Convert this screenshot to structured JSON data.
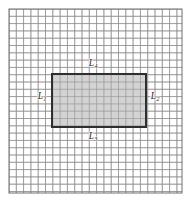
{
  "figure": {
    "background_color": "#ffffff",
    "frame": {
      "name": "outer-frame",
      "stroke_color": "#6f6f6f",
      "stroke_width": 1,
      "x": 9,
      "y": 9,
      "width": 173,
      "height": 184
    },
    "grid": {
      "name": "graph-paper-grid",
      "line_color": "#8d8d8d",
      "line_width": 0.75,
      "cell_size": 7.3,
      "columns": 23,
      "rows": 25
    },
    "region": {
      "name": "shaded-rectangle",
      "fill_color": "#c6c6c6",
      "fill_opacity": 0.78,
      "stroke_color": "#2f2f2f",
      "stroke_width": 2,
      "x": 52,
      "y": 74,
      "width": 94,
      "height": 53
    },
    "labels": [
      {
        "id": "label-L1",
        "name": "edge-label-L1",
        "base": "L",
        "subscript": "1",
        "edge": "left",
        "x": 42,
        "y": 97
      },
      {
        "id": "label-L2",
        "name": "edge-label-L2",
        "base": "L",
        "subscript": "2",
        "edge": "right",
        "x": 155,
        "y": 97
      },
      {
        "id": "label-L3",
        "name": "edge-label-L3",
        "base": "L",
        "subscript": "3",
        "edge": "bottom",
        "x": 93,
        "y": 137
      },
      {
        "id": "label-L4",
        "name": "edge-label-L4",
        "base": "L",
        "subscript": "4",
        "edge": "top",
        "x": 93,
        "y": 64
      }
    ]
  }
}
